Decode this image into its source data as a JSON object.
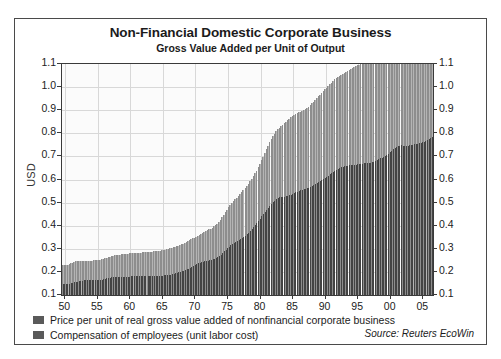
{
  "chart_data": {
    "type": "bar",
    "title": "Non-Financial Domestic Corporate Business",
    "subtitle": "Gross Value Added per Unit of Output",
    "ylabel": "USD",
    "xlabel": "",
    "ylim": [
      0.1,
      1.1
    ],
    "grid": true,
    "legend_position": "below-left",
    "source": "Source: Reuters EcoWin",
    "ytick_labels": [
      "1.1",
      "1.0",
      "0.9",
      "0.8",
      "0.7",
      "0.6",
      "0.5",
      "0.4",
      "0.3",
      "0.2",
      "0.1"
    ],
    "ytick_values": [
      1.1,
      1.0,
      0.9,
      0.8,
      0.7,
      0.6,
      0.5,
      0.4,
      0.3,
      0.2,
      0.1
    ],
    "xtick_labels": [
      "50",
      "55",
      "60",
      "65",
      "70",
      "75",
      "80",
      "85",
      "90",
      "95",
      "00",
      "05"
    ],
    "xtick_values": [
      1950,
      1955,
      1960,
      1965,
      1970,
      1975,
      1980,
      1985,
      1990,
      1995,
      2000,
      2005
    ],
    "categories": [
      1950,
      1951,
      1952,
      1953,
      1954,
      1955,
      1956,
      1957,
      1958,
      1959,
      1960,
      1961,
      1962,
      1963,
      1964,
      1965,
      1966,
      1967,
      1968,
      1969,
      1970,
      1971,
      1972,
      1973,
      1974,
      1975,
      1976,
      1977,
      1978,
      1979,
      1980,
      1981,
      1982,
      1983,
      1984,
      1985,
      1986,
      1987,
      1988,
      1989,
      1990,
      1991,
      1992,
      1993,
      1994,
      1995,
      1996,
      1997,
      1998,
      1999,
      2000,
      2001,
      2002,
      2003,
      2004,
      2005,
      2006
    ],
    "series": [
      {
        "name": "Price per unit of real gross value added of nonfinancial corporate business",
        "color": "#b4b4b4",
        "values": [
          0.232,
          0.246,
          0.247,
          0.248,
          0.25,
          0.254,
          0.262,
          0.271,
          0.276,
          0.279,
          0.282,
          0.283,
          0.286,
          0.288,
          0.292,
          0.297,
          0.305,
          0.314,
          0.327,
          0.343,
          0.358,
          0.375,
          0.389,
          0.41,
          0.452,
          0.497,
          0.525,
          0.558,
          0.597,
          0.645,
          0.706,
          0.771,
          0.816,
          0.84,
          0.866,
          0.886,
          0.899,
          0.918,
          0.948,
          0.979,
          1.009,
          1.038,
          1.053,
          1.072,
          1.089,
          1.102,
          1.112,
          1.118,
          1.117,
          1.122,
          1.138,
          1.154,
          1.157,
          1.17,
          1.197,
          1.232,
          1.265
        ]
      },
      {
        "name": "Compensation of employees (unit labor cost)",
        "color": "#5a5a5a",
        "values": [
          0.148,
          0.156,
          0.162,
          0.166,
          0.166,
          0.164,
          0.173,
          0.178,
          0.18,
          0.179,
          0.182,
          0.182,
          0.182,
          0.182,
          0.184,
          0.185,
          0.191,
          0.2,
          0.209,
          0.223,
          0.239,
          0.246,
          0.253,
          0.264,
          0.294,
          0.318,
          0.334,
          0.353,
          0.38,
          0.414,
          0.456,
          0.489,
          0.521,
          0.525,
          0.532,
          0.546,
          0.557,
          0.566,
          0.581,
          0.598,
          0.62,
          0.641,
          0.655,
          0.661,
          0.664,
          0.669,
          0.671,
          0.677,
          0.693,
          0.707,
          0.735,
          0.748,
          0.745,
          0.752,
          0.757,
          0.768,
          0.787
        ]
      }
    ]
  },
  "legend": {
    "items": [
      {
        "label": "Price per unit of real gross value added of nonfinancial corporate business",
        "color": "#5a5a5a"
      },
      {
        "label": "Compensation of employees (unit labor cost)",
        "color": "#5a5a5a"
      }
    ]
  }
}
